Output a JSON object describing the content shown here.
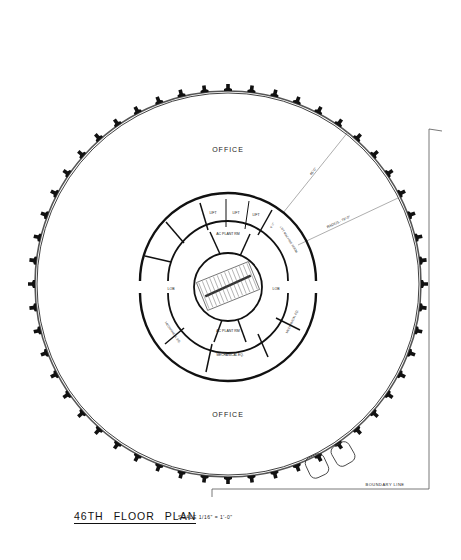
{
  "drawing": {
    "type": "architectural floor plan",
    "title_words": [
      "46TH",
      "FLOOR",
      "PLAN"
    ],
    "scale_label": "SCALE",
    "scale_value": "1/16\" = 1'-0\"",
    "colors": {
      "ink": "#111111",
      "paper": "#ffffff",
      "thin_line": "#888888"
    }
  },
  "rooms": {
    "office_north": "OFFICE",
    "office_south": "OFFICE",
    "lift_1": "LIFT",
    "lift_2": "LIFT",
    "lift_3": "LIFT",
    "ac_plant_north": "AC PLANT RM",
    "ac_plant_south": "AC PLANT RM",
    "lift_machine_room": "LIFT MACHINE ROOM",
    "lobby_west": "LOB",
    "lobby_east": "LOB",
    "mech_west": "MECHANICAL EQ.",
    "mech_south": "MECHANICAL EQ.",
    "mech_east": "MECHANICAL EQ."
  },
  "dimensions": {
    "span_label": "45'-0\"",
    "radius_label": "RADIUS - 79'-0\"",
    "core_dim": "6'-0\""
  },
  "site": {
    "boundary_label": "BOUNDARY LINE"
  }
}
